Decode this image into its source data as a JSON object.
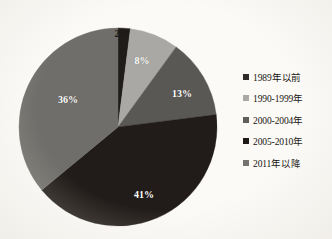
{
  "chart_data": {
    "type": "pie",
    "title": "",
    "categories": [
      "1989年以前",
      "1990-1999年",
      "2000-2004年",
      "2005-2010年",
      "2011年以降"
    ],
    "values": [
      2,
      8,
      13,
      41,
      36
    ],
    "value_labels": [
      "2%",
      "8%",
      "13%",
      "41%",
      "36%"
    ],
    "colors": [
      "#201c1a",
      "#a9a8a4",
      "#595855",
      "#211c19",
      "#6f6e6a"
    ],
    "start_angle_deg": 0,
    "direction": "clockwise",
    "legend_position": "right",
    "grid": false,
    "xlabel": "",
    "ylabel": ""
  },
  "slices": [
    {
      "label": "2%",
      "percent": 2,
      "color": "#201c1a",
      "category": "1989年以前",
      "label_x": 104,
      "label_y": 6,
      "outside": true
    },
    {
      "label": "8%",
      "percent": 8,
      "color": "#a9a8a4",
      "category": "1990-1999年",
      "label_x": 124,
      "label_y": 33,
      "outside": false
    },
    {
      "label": "13%",
      "percent": 13,
      "color": "#595855",
      "category": "2000-2004年",
      "label_x": 164,
      "label_y": 66,
      "outside": false
    },
    {
      "label": "41%",
      "percent": 41,
      "color": "#211c19",
      "category": "2005-2010年",
      "label_x": 126,
      "label_y": 167,
      "outside": false
    },
    {
      "label": "36%",
      "percent": 36,
      "color": "#6f6e6a",
      "category": "2011年以降",
      "label_x": 50,
      "label_y": 72,
      "outside": false
    }
  ],
  "legend": {
    "items": [
      {
        "label": "1989年以前",
        "color": "#2e2b28"
      },
      {
        "label": "1990-1999年",
        "color": "#a9a8a4"
      },
      {
        "label": "2000-2004年",
        "color": "#5f5e5b"
      },
      {
        "label": "2005-2010年",
        "color": "#1d1a17"
      },
      {
        "label": "2011年以降",
        "color": "#73726e"
      }
    ]
  },
  "style": {
    "background": "#fbfaf7",
    "label_text_color": "#ffffff",
    "outside_label_color": "#1d1a17"
  }
}
